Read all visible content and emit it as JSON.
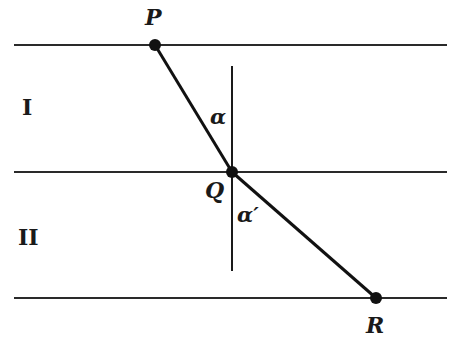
{
  "diagram": {
    "colors": {
      "line": "#2a2a2a",
      "point": "#111111",
      "background": "#ffffff"
    },
    "boundaries": [
      {
        "name": "top-boundary",
        "y": 45,
        "x1": 14,
        "x2": 447
      },
      {
        "name": "interface",
        "y": 172,
        "x1": 14,
        "x2": 447
      },
      {
        "name": "bottom-boundary",
        "y": 298,
        "x1": 14,
        "x2": 447
      }
    ],
    "normal": {
      "x": 232,
      "y1": 66,
      "y2": 271
    },
    "points": {
      "P": {
        "label": "P",
        "x": 155,
        "y": 45
      },
      "Q": {
        "label": "Q",
        "x": 232,
        "y": 172
      },
      "R": {
        "label": "R",
        "x": 376,
        "y": 298
      }
    },
    "regions": {
      "upper": "I",
      "lower": "II"
    },
    "angles": {
      "incident": "α",
      "refracted": "α′"
    }
  }
}
